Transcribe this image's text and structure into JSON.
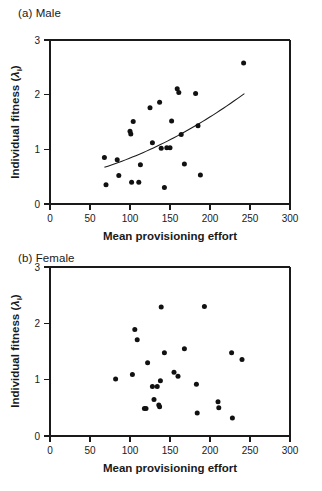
{
  "figure": {
    "xlabel": "Mean provisioning effort",
    "ylabel_main": "Individual fitness (",
    "ylabel_symbol": "λ",
    "ylabel_subscript": "i",
    "ylabel_close": ")",
    "point_color": "#111111",
    "axis_color": "#1a1a1a",
    "curve_color": "#1a1a1a"
  },
  "panels": [
    {
      "id": "a",
      "label": "(a) Male"
    },
    {
      "id": "b",
      "label": "(b) Female"
    }
  ],
  "axis": {
    "x_ticks": [
      "0",
      "50",
      "100",
      "150",
      "200",
      "250",
      "300"
    ],
    "y_ticks": [
      "0",
      "1",
      "2",
      "3"
    ],
    "xlim": [
      0,
      300
    ],
    "ylim": [
      0,
      3
    ]
  },
  "chart_data": [
    {
      "type": "scatter",
      "title": "(a) Male",
      "xlabel": "Mean provisioning effort",
      "ylabel": "Individual fitness (λᵢ)",
      "xlim": [
        0,
        300
      ],
      "ylim": [
        0,
        3
      ],
      "xticks": [
        0,
        50,
        100,
        150,
        200,
        250,
        300
      ],
      "yticks": [
        0,
        1,
        2,
        3
      ],
      "grid": false,
      "legend": null,
      "points": [
        [
          68,
          0.85
        ],
        [
          70,
          0.35
        ],
        [
          84,
          0.81
        ],
        [
          86,
          0.52
        ],
        [
          100,
          1.33
        ],
        [
          101,
          1.28
        ],
        [
          102,
          0.4
        ],
        [
          104,
          1.51
        ],
        [
          111,
          0.4
        ],
        [
          113,
          0.72
        ],
        [
          125,
          1.76
        ],
        [
          128,
          1.12
        ],
        [
          137,
          1.86
        ],
        [
          139,
          1.02
        ],
        [
          143,
          0.3
        ],
        [
          146,
          1.03
        ],
        [
          150,
          1.03
        ],
        [
          152,
          1.52
        ],
        [
          159,
          2.11
        ],
        [
          161,
          2.04
        ],
        [
          164,
          1.27
        ],
        [
          168,
          0.73
        ],
        [
          182,
          2.02
        ],
        [
          185,
          1.43
        ],
        [
          188,
          0.53
        ],
        [
          242,
          2.58
        ]
      ],
      "fit_curve": {
        "description": "fitted regression curve, slightly convex increasing",
        "x_start": 68,
        "x_end": 243,
        "y_start": 0.67,
        "y_end": 2.02
      }
    },
    {
      "type": "scatter",
      "title": "(b) Female",
      "xlabel": "Mean provisioning effort",
      "ylabel": "Individual fitness (λᵢ)",
      "xlim": [
        0,
        300
      ],
      "ylim": [
        0,
        3
      ],
      "xticks": [
        0,
        50,
        100,
        150,
        200,
        250,
        300
      ],
      "yticks": [
        0,
        1,
        2,
        3
      ],
      "grid": false,
      "legend": null,
      "points": [
        [
          82,
          1.01
        ],
        [
          103,
          1.09
        ],
        [
          106,
          1.89
        ],
        [
          109,
          1.71
        ],
        [
          118,
          0.49
        ],
        [
          120,
          0.49
        ],
        [
          122,
          1.3
        ],
        [
          128,
          0.88
        ],
        [
          130,
          0.65
        ],
        [
          134,
          0.88
        ],
        [
          136,
          0.55
        ],
        [
          137,
          0.52
        ],
        [
          138,
          0.98
        ],
        [
          139,
          2.29
        ],
        [
          143,
          1.48
        ],
        [
          155,
          1.13
        ],
        [
          160,
          1.06
        ],
        [
          168,
          1.55
        ],
        [
          183,
          0.92
        ],
        [
          184,
          0.41
        ],
        [
          193,
          2.3
        ],
        [
          210,
          0.61
        ],
        [
          211,
          0.5
        ],
        [
          227,
          1.48
        ],
        [
          228,
          0.32
        ],
        [
          240,
          1.36
        ]
      ],
      "fit_curve": null
    }
  ]
}
